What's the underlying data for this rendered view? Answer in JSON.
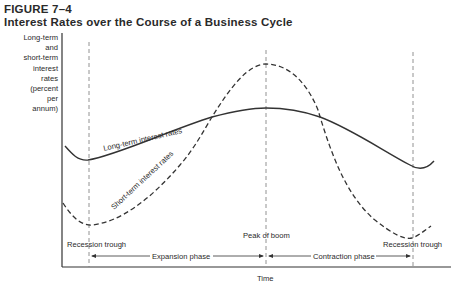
{
  "figure": {
    "number": "FIGURE 7–4",
    "title": "Interest Rates over the Course of a Business Cycle"
  },
  "chart_data": {
    "type": "line",
    "title": "Interest Rates over the Course of a Business Cycle",
    "xlabel": "Time",
    "ylabel": "Long-term and short-term interest rates (percent per annum)",
    "ylabel_lines": [
      "Long-term",
      "and",
      "short-term",
      "interest",
      "rates",
      "(percent",
      "per",
      "annum)"
    ],
    "grid": false,
    "legend": "inline curve labels",
    "axis_ticks": "none (schematic)",
    "series": [
      {
        "name": "Long-term interest rates",
        "style": "solid",
        "points": [
          {
            "x": 65,
            "y": 146
          },
          {
            "x": 88,
            "y": 160
          },
          {
            "x": 150,
            "y": 140
          },
          {
            "x": 212,
            "y": 117
          },
          {
            "x": 266,
            "y": 108
          },
          {
            "x": 320,
            "y": 117
          },
          {
            "x": 380,
            "y": 150
          },
          {
            "x": 421,
            "y": 169
          },
          {
            "x": 434,
            "y": 161
          }
        ]
      },
      {
        "name": "Short-term interest rates",
        "style": "dashed",
        "points": [
          {
            "x": 63,
            "y": 203
          },
          {
            "x": 92,
            "y": 225
          },
          {
            "x": 150,
            "y": 190
          },
          {
            "x": 212,
            "y": 117
          },
          {
            "x": 266,
            "y": 64
          },
          {
            "x": 320,
            "y": 117
          },
          {
            "x": 360,
            "y": 205
          },
          {
            "x": 412,
            "y": 238
          },
          {
            "x": 431,
            "y": 226
          }
        ]
      }
    ],
    "markers": [
      {
        "label": "Recession trough",
        "x": 89
      },
      {
        "label": "Peak of boom",
        "x": 266
      },
      {
        "label": "Recession trough",
        "x": 413
      }
    ],
    "phases": [
      {
        "label": "Expansion phase",
        "from": "Recession trough",
        "to": "Peak of boom"
      },
      {
        "label": "Contraction phase",
        "from": "Peak of boom",
        "to": "Recession trough"
      }
    ],
    "annotations": {
      "long_term_label": "Long-term interest rates",
      "short_term_label": "Short-term interest rates"
    }
  },
  "labels": {
    "trough_left": "Recession trough",
    "peak": "Peak of boom",
    "trough_right": "Recession trough",
    "expansion": "Expansion phase",
    "contraction": "Contraction phase",
    "xaxis": "Time",
    "long_term": "Long-term interest rates",
    "short_term": "Short-term interest rates"
  }
}
